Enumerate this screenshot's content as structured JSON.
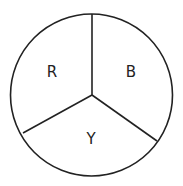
{
  "diagram": {
    "type": "circle-divided-into-three-sectors",
    "stroke_color": "#222222",
    "background": "#ffffff",
    "sectors": [
      {
        "label": "R",
        "position": "upper-left"
      },
      {
        "label": "B",
        "position": "upper-right"
      },
      {
        "label": "Y",
        "position": "bottom"
      }
    ]
  }
}
